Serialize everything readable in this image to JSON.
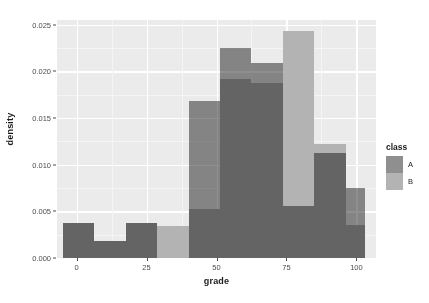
{
  "chart_data": {
    "type": "bar",
    "subtype": "overlapping-histogram",
    "title": "",
    "xlabel": "grade",
    "ylabel": "density",
    "xlim": [
      -7,
      107
    ],
    "ylim": [
      0,
      0.0255
    ],
    "xticks": [
      0,
      25,
      50,
      75,
      100
    ],
    "xtick_labels": [
      "0",
      "25",
      "50",
      "75",
      "100"
    ],
    "yticks": [
      0.0,
      0.005,
      0.01,
      0.015,
      0.02,
      0.025
    ],
    "ytick_labels": [
      "0.000",
      "0.005",
      "0.010",
      "0.015",
      "0.020",
      "0.025"
    ],
    "grid": true,
    "grid_color": "#ffffff",
    "panel_background": "#ebebeb",
    "legend": {
      "title": "class",
      "position": "right",
      "entries": [
        {
          "label": "A",
          "color": "#8f8f8f"
        },
        {
          "label": "B",
          "color": "#b3b3b3"
        }
      ]
    },
    "bin_width": 11.3,
    "series": [
      {
        "name": "A",
        "color": "#8f8f8f",
        "bins": [
          {
            "x0": -5.0,
            "x1": 6.3,
            "value": 0.00375
          },
          {
            "x0": 6.3,
            "x1": 17.5,
            "value": 0.00187
          },
          {
            "x0": 17.5,
            "x1": 28.8,
            "value": 0.00375
          },
          {
            "x0": 28.8,
            "x1": 40.0,
            "value": 0.0
          },
          {
            "x0": 40.0,
            "x1": 51.3,
            "value": 0.01685
          },
          {
            "x0": 51.3,
            "x1": 62.5,
            "value": 0.0225
          },
          {
            "x0": 62.5,
            "x1": 73.8,
            "value": 0.0209
          },
          {
            "x0": 73.8,
            "x1": 85.0,
            "value": 0.0056
          },
          {
            "x0": 85.0,
            "x1": 96.3,
            "value": 0.01122
          },
          {
            "x0": 96.3,
            "x1": 103.0,
            "value": 0.0075
          }
        ]
      },
      {
        "name": "B",
        "color": "#b3b3b3",
        "bins": [
          {
            "x0": -5.0,
            "x1": 6.3,
            "value": 0.00375
          },
          {
            "x0": 6.3,
            "x1": 17.5,
            "value": 0.00187
          },
          {
            "x0": 17.5,
            "x1": 28.8,
            "value": 0.00375
          },
          {
            "x0": 28.8,
            "x1": 40.0,
            "value": 0.00345
          },
          {
            "x0": 40.0,
            "x1": 51.3,
            "value": 0.0052
          },
          {
            "x0": 51.3,
            "x1": 62.5,
            "value": 0.0192
          },
          {
            "x0": 62.5,
            "x1": 73.8,
            "value": 0.0188
          },
          {
            "x0": 73.8,
            "x1": 85.0,
            "value": 0.02435
          },
          {
            "x0": 85.0,
            "x1": 96.3,
            "value": 0.01225
          },
          {
            "x0": 96.3,
            "x1": 103.0,
            "value": 0.0035
          }
        ]
      }
    ]
  }
}
